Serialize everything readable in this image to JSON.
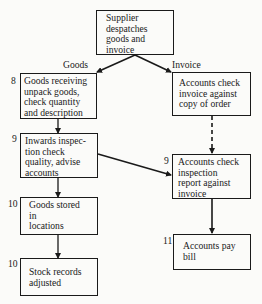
{
  "diagram": {
    "type": "flowchart",
    "nodes": {
      "start": {
        "text": "Supplier\ndespatches\ngoods and\ninvoice"
      },
      "goods_receiving": {
        "step": "8",
        "text": "Goods  receiving\nunpack goods,\ncheck quantity\nand description"
      },
      "accounts_check_invoice": {
        "text": "Accounts check\ninvoice against\ncopy of order"
      },
      "inwards_inspection": {
        "step": "9",
        "text": "Inwards inspec-\ntion check\nquality, advise\naccounts"
      },
      "accounts_check_inspection": {
        "step": "9",
        "text": "Accounts check\ninspection\nreport against\ninvoice"
      },
      "goods_stored": {
        "step": "10",
        "text": "Goods stored\nin\nlocations"
      },
      "stock_records": {
        "step": "10",
        "text": "Stock records\nadjusted"
      },
      "accounts_pay": {
        "step": "11",
        "text": "Accounts pay\nbill"
      }
    },
    "edge_labels": {
      "goods": "Goods",
      "invoice": "Invoice"
    },
    "edges": [
      {
        "from": "start",
        "to": "goods_receiving",
        "label": "Goods",
        "style": "solid"
      },
      {
        "from": "start",
        "to": "accounts_check_invoice",
        "label": "Invoice",
        "style": "solid"
      },
      {
        "from": "goods_receiving",
        "to": "inwards_inspection",
        "style": "solid"
      },
      {
        "from": "accounts_check_invoice",
        "to": "accounts_check_inspection",
        "style": "dashed"
      },
      {
        "from": "inwards_inspection",
        "to": "accounts_check_inspection",
        "style": "solid"
      },
      {
        "from": "inwards_inspection",
        "to": "goods_stored",
        "style": "solid"
      },
      {
        "from": "goods_stored",
        "to": "stock_records",
        "style": "solid"
      },
      {
        "from": "accounts_check_inspection",
        "to": "accounts_pay",
        "style": "solid"
      }
    ]
  }
}
